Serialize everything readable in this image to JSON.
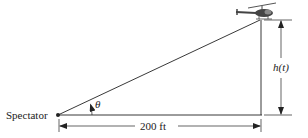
{
  "diagram": {
    "labels": {
      "spectator": "Spectator",
      "angle": "θ",
      "height": "h(t)",
      "distance": "200 ft"
    },
    "icons": [
      "helicopter-icon"
    ],
    "colors": {
      "line": "#222222",
      "background": "#ffffff"
    }
  }
}
